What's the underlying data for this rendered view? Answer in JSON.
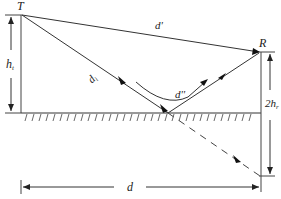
{
  "diagram": {
    "points": {
      "transmitter": {
        "label": "T"
      },
      "receiver": {
        "label": "R"
      }
    },
    "labels": {
      "direct_path": "d'",
      "incident_path": "d",
      "incident_sub": "i",
      "reflected_path": "d''",
      "tx_height": "h",
      "tx_height_sub": "t",
      "rx_image_height": "2h",
      "rx_image_height_sub": "r",
      "distance": "d"
    },
    "colors": {
      "line": "#333333",
      "ground_hatch": "#333333",
      "background": "#ffffff"
    }
  }
}
